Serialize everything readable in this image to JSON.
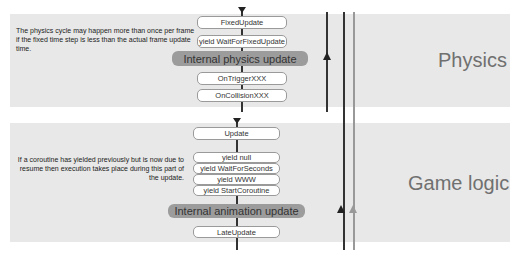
{
  "physics_section": {
    "label": "Physics",
    "note": "The physics cycle may happen more than once per frame if the fixed time step is less than the actual frame update time.",
    "steps": [
      {
        "type": "box",
        "label": "FixedUpdate"
      },
      {
        "type": "box",
        "label": "yield WaitForFixedUpdate"
      },
      {
        "type": "pill",
        "label": "Internal physics update"
      },
      {
        "type": "box",
        "label": "OnTriggerXXX"
      },
      {
        "type": "box",
        "label": "OnCollisionXXX"
      }
    ]
  },
  "game_logic_section": {
    "label": "Game logic",
    "note": "If a coroutine has yielded previously but is now due to resume then execution takes place during this part of the update.",
    "steps": [
      {
        "type": "box",
        "label": "Update"
      },
      {
        "type": "box",
        "label": "yield null"
      },
      {
        "type": "box",
        "label": "yield WaitForSeconds"
      },
      {
        "type": "box",
        "label": "yield WWW"
      },
      {
        "type": "box",
        "label": "yield StartCoroutine"
      },
      {
        "type": "pill",
        "label": "Internal animation update"
      },
      {
        "type": "box",
        "label": "LateUpdate"
      }
    ]
  },
  "colors": {
    "band": "#e8e8e8",
    "pill": "#9c9c9c",
    "box_border": "#9a9a9a",
    "line_dark": "#333333",
    "line_gray": "#999999",
    "label": "#707070"
  }
}
